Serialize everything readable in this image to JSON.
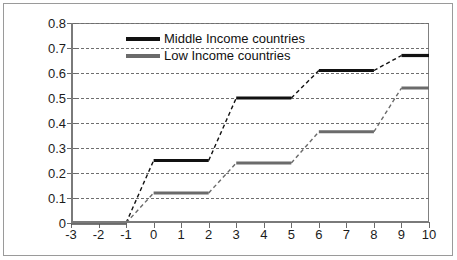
{
  "chart_data": {
    "type": "line",
    "title": "",
    "subtitle": "",
    "xlabel": "",
    "ylabel": "",
    "xlim": [
      -3,
      10
    ],
    "ylim": [
      0,
      0.8
    ],
    "grid": true,
    "legend_position": "top-center",
    "x_ticks": [
      "-3",
      "-2",
      "-1",
      "0",
      "1",
      "2",
      "3",
      "4",
      "5",
      "6",
      "7",
      "8",
      "9",
      "10"
    ],
    "x_tick_values": [
      -3,
      -2,
      -1,
      0,
      1,
      2,
      3,
      4,
      5,
      6,
      7,
      8,
      9,
      10
    ],
    "y_ticks": [
      "0",
      "0.1",
      "0.2",
      "0.3",
      "0.4",
      "0.5",
      "0.6",
      "0.7",
      "0.8"
    ],
    "y_tick_values": [
      0,
      0.1,
      0.2,
      0.3,
      0.4,
      0.5,
      0.6,
      0.7,
      0.8
    ],
    "x": [
      -3,
      -2,
      -1,
      0,
      1,
      2,
      3,
      4,
      5,
      6,
      7,
      8,
      9,
      10
    ],
    "series": [
      {
        "name": "Middle Income countries",
        "color": "#111111",
        "values": [
          0,
          0,
          0,
          0.25,
          0.25,
          0.25,
          0.5,
          0.5,
          0.5,
          0.61,
          0.61,
          0.61,
          0.67,
          0.67
        ]
      },
      {
        "name": "Low Income countries",
        "color": "#6b6b6b",
        "values": [
          0,
          0,
          0,
          0.12,
          0.12,
          0.12,
          0.24,
          0.24,
          0.24,
          0.365,
          0.365,
          0.365,
          0.54,
          0.54
        ]
      }
    ]
  },
  "legend": {
    "items": [
      {
        "label": "Middle Income countries",
        "color": "#111111"
      },
      {
        "label": "Low Income countries",
        "color": "#6b6b6b"
      }
    ]
  },
  "colors": {
    "middle_income": "#111111",
    "low_income": "#6b6b6b",
    "gridline": "#6e6e6e",
    "axis": "#7a7a7a",
    "frame": "#9a9a9a",
    "background": "#ffffff",
    "text": "#1b1b1b"
  }
}
